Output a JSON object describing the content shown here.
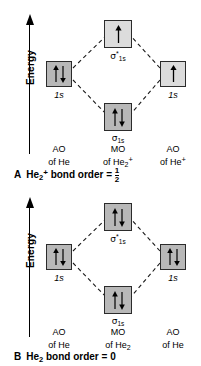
{
  "figure": {
    "axis_label": "Energy",
    "axis_icon": "up-arrow-icon"
  },
  "panels": [
    {
      "id": "panel-a",
      "caption_letter": "A",
      "caption_species": "He",
      "caption_species_sub": "2",
      "caption_species_sup": "+",
      "caption_text": "bond order =",
      "caption_value_num": "1",
      "caption_value_den": "2",
      "antibonding": {
        "label_sigma": "σ",
        "label_star": "*",
        "label_sub": "1s",
        "electrons": [
          "up"
        ],
        "fill": "light"
      },
      "bonding": {
        "label_sigma": "σ",
        "label_star": "",
        "label_sub": "1s",
        "electrons": [
          "up",
          "down"
        ],
        "fill": "dark"
      },
      "left_ao": {
        "label": "1s",
        "electrons": [
          "up",
          "down"
        ],
        "fill": "dark"
      },
      "right_ao": {
        "label": "1s",
        "electrons": [
          "up"
        ],
        "fill": "light"
      },
      "columns": [
        {
          "line1": "AO",
          "line2_pre": "of He",
          "line2_sub": "",
          "line2_sup": ""
        },
        {
          "line1": "MO",
          "line2_pre": "of He",
          "line2_sub": "2",
          "line2_sup": "+"
        },
        {
          "line1": "AO",
          "line2_pre": "of He",
          "line2_sub": "",
          "line2_sup": "+"
        }
      ]
    },
    {
      "id": "panel-b",
      "caption_letter": "B",
      "caption_species": "He",
      "caption_species_sub": "2",
      "caption_species_sup": "",
      "caption_text": "bond order = 0",
      "caption_value_num": "",
      "caption_value_den": "",
      "antibonding": {
        "label_sigma": "σ",
        "label_star": "*",
        "label_sub": "1s",
        "electrons": [
          "up",
          "down"
        ],
        "fill": "dark"
      },
      "bonding": {
        "label_sigma": "σ",
        "label_star": "",
        "label_sub": "1s",
        "electrons": [
          "up",
          "down"
        ],
        "fill": "dark"
      },
      "left_ao": {
        "label": "1s",
        "electrons": [
          "up",
          "down"
        ],
        "fill": "dark"
      },
      "right_ao": {
        "label": "1s",
        "electrons": [
          "up",
          "down"
        ],
        "fill": "dark"
      },
      "columns": [
        {
          "line1": "AO",
          "line2_pre": "of He",
          "line2_sub": "",
          "line2_sup": ""
        },
        {
          "line1": "MO",
          "line2_pre": "of He",
          "line2_sub": "2",
          "line2_sup": ""
        },
        {
          "line1": "AO",
          "line2_pre": "of He",
          "line2_sub": "",
          "line2_sup": ""
        }
      ]
    }
  ],
  "colors": {
    "box_dark": "#b8b8b8",
    "box_light": "#dcdcdc",
    "stroke": "#2b2b2b",
    "ink": "#000000",
    "background": "#ffffff"
  }
}
